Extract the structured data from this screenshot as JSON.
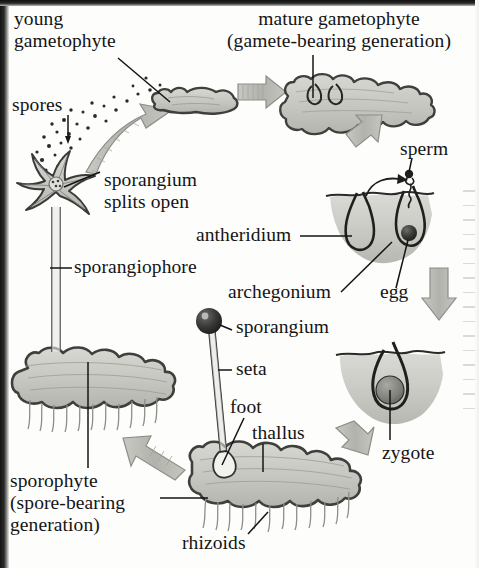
{
  "diagram": {
    "type": "life-cycle",
    "palette": {
      "ink": "#141414",
      "tissue_fill": "#c9c9c4",
      "tissue_stroke": "#4a4a47",
      "arrow_fill": "#b9b9b4",
      "arrow_stroke": "#8e8e89",
      "soil_fill": "#c4c4bf",
      "background": "#fdfdfc",
      "edge_artifact": "#151515"
    },
    "labels": [
      {
        "id": "young-gametophyte",
        "text": "young\ngametophyte",
        "x": 14,
        "y": 10,
        "size": 20,
        "align": "left"
      },
      {
        "id": "mature-gametophyte",
        "text": "mature gametophyte\n(gamete-bearing generation)",
        "x": 205,
        "y": 10,
        "size": 20,
        "align": "center"
      },
      {
        "id": "spores",
        "text": "spores",
        "x": 12,
        "y": 96,
        "size": 20,
        "align": "left"
      },
      {
        "id": "sperm",
        "text": "sperm",
        "x": 400,
        "y": 140,
        "size": 20,
        "align": "left"
      },
      {
        "id": "sporangium-splits",
        "text": "sporangium\nsplits open",
        "x": 104,
        "y": 171,
        "size": 20,
        "align": "left"
      },
      {
        "id": "antheridium",
        "text": "antheridium",
        "x": 196,
        "y": 226,
        "size": 20,
        "align": "left"
      },
      {
        "id": "sporangiophore",
        "text": "sporangiophore",
        "x": 74,
        "y": 258,
        "size": 20,
        "align": "left"
      },
      {
        "id": "archegonium",
        "text": "archegonium",
        "x": 228,
        "y": 283,
        "size": 20,
        "align": "left"
      },
      {
        "id": "egg",
        "text": "egg",
        "x": 380,
        "y": 283,
        "size": 20,
        "align": "left"
      },
      {
        "id": "sporangium",
        "text": "sporangium",
        "x": 236,
        "y": 318,
        "size": 20,
        "align": "left"
      },
      {
        "id": "seta",
        "text": "seta",
        "x": 236,
        "y": 360,
        "size": 20,
        "align": "left"
      },
      {
        "id": "foot",
        "text": "foot",
        "x": 230,
        "y": 398,
        "size": 20,
        "align": "left"
      },
      {
        "id": "thallus",
        "text": "thallus",
        "x": 252,
        "y": 424,
        "size": 20,
        "align": "left"
      },
      {
        "id": "zygote",
        "text": "zygote",
        "x": 382,
        "y": 444,
        "size": 20,
        "align": "left"
      },
      {
        "id": "sporophyte",
        "text": "sporophyte\n(spore-bearing\ngeneration)",
        "x": 10,
        "y": 473,
        "size": 20,
        "align": "left"
      },
      {
        "id": "rhizoids",
        "text": "rhizoids",
        "x": 182,
        "y": 534,
        "size": 20,
        "align": "left"
      }
    ],
    "structures": [
      {
        "id": "young-gametophyte-thallus",
        "desc": "small lobed grey thallus, top-left-center"
      },
      {
        "id": "mature-gametophyte-thallus",
        "desc": "large lobed grey thallus with two gametangia, top-right"
      },
      {
        "id": "antheridium-archegonium-soil",
        "desc": "soil cross-section with antheridium (left flask) and archegonium (right flask with dark egg)"
      },
      {
        "id": "zygote-soil",
        "desc": "soil cross-section with archegonium containing dark round zygote"
      },
      {
        "id": "sporophyte-on-thallus",
        "desc": "sporophyte: dark round sporangium atop slender seta with foot embedded in lobed thallus bearing rhizoids"
      },
      {
        "id": "sporangium-split-star",
        "desc": "star-shaped opened sporangium on sporangiophore releasing spores"
      },
      {
        "id": "spore-cloud",
        "desc": "scattered dots representing dispersing spores"
      }
    ],
    "arrows": [
      {
        "id": "arrow-spores-to-young",
        "from": "spores",
        "to": "young-gametophyte"
      },
      {
        "id": "arrow-young-to-mature",
        "from": "young-gametophyte",
        "to": "mature-gametophyte"
      },
      {
        "id": "arrow-mature-to-fertilization",
        "from": "mature-gametophyte",
        "to": "antheridium-archegonium"
      },
      {
        "id": "arrow-fertilization-to-zygote",
        "from": "fertilization",
        "to": "zygote"
      },
      {
        "id": "arrow-zygote-to-sporophyte",
        "from": "zygote",
        "to": "sporophyte"
      },
      {
        "id": "arrow-sporophyte-to-sporangium",
        "from": "sporophyte",
        "to": "sporangium-splits-open"
      },
      {
        "id": "arrow-sperm-swim",
        "from": "antheridium",
        "to": "archegonium"
      }
    ]
  }
}
